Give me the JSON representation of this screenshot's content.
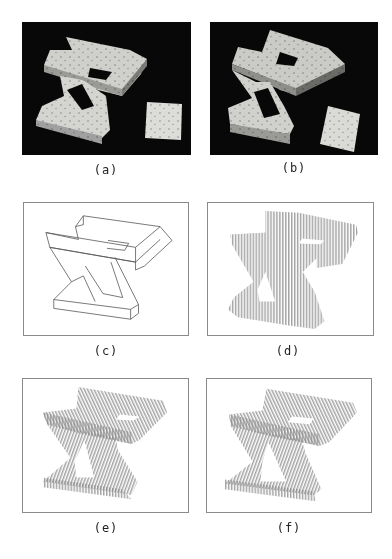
{
  "figure": {
    "panels": [
      {
        "id": "a",
        "caption": "(a)",
        "style": "shaded render, black background, with surface dots"
      },
      {
        "id": "b",
        "caption": "(b)",
        "style": "shaded render, black background, rotated view"
      },
      {
        "id": "c",
        "caption": "(c)",
        "style": "line drawing"
      },
      {
        "id": "d",
        "caption": "(d)",
        "style": "vertical hatching silhouette"
      },
      {
        "id": "e",
        "caption": "(e)",
        "style": "directional hatching by face"
      },
      {
        "id": "f",
        "caption": "(f)",
        "style": "directional hatching by face, variant"
      }
    ]
  },
  "colors": {
    "background": "#ffffff",
    "render_bg": "#080808",
    "surface_light": "#d8d8d4",
    "surface_mid": "#a8a8a4",
    "surface_dark": "#6e6e6a",
    "hatch": "#8c8c8c",
    "frame_border": "#8a8a8a"
  }
}
